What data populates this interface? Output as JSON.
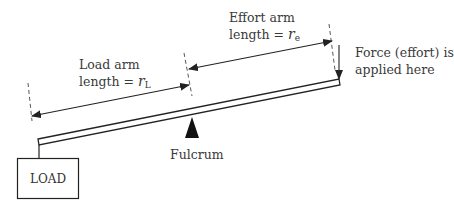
{
  "diagram": {
    "type": "lever",
    "colors": {
      "stroke": "#222222",
      "text": "#3a3a3a",
      "background": "#ffffff"
    },
    "labels": {
      "load_arm_line1": "Load arm",
      "load_arm_line2_prefix": "length = ",
      "load_arm_var": "r",
      "load_arm_sub": "L",
      "effort_arm_line1": "Effort arm",
      "effort_arm_line2_prefix": "length = ",
      "effort_arm_var": "r",
      "effort_arm_sub": "e",
      "force_line1": "Force (effort) is",
      "force_line2": "applied here",
      "fulcrum": "Fulcrum",
      "load_box": "LOAD"
    },
    "components": [
      {
        "name": "beam",
        "shape": "thin-rectangle",
        "from": [
          38,
          142
        ],
        "to": [
          340,
          82
        ]
      },
      {
        "name": "load-box",
        "shape": "rectangle",
        "x": 17,
        "y": 158,
        "width": 62,
        "height": 41
      },
      {
        "name": "fulcrum",
        "shape": "triangle",
        "apex": [
          192,
          118
        ],
        "base": [
          [
            185,
            138
          ],
          [
            199,
            138
          ]
        ]
      },
      {
        "name": "load-arm-dimension",
        "shape": "double-arrow",
        "from": [
          32,
          116
        ],
        "to": [
          189,
          85
        ]
      },
      {
        "name": "effort-arm-dimension",
        "shape": "double-arrow",
        "from": [
          189,
          69
        ],
        "to": [
          332,
          41
        ]
      },
      {
        "name": "force-arrow",
        "shape": "arrow-down",
        "from": [
          339,
          45
        ],
        "to": [
          339,
          79
        ]
      }
    ]
  }
}
